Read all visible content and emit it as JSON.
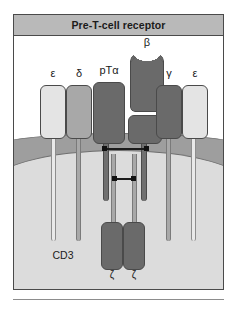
{
  "figure": {
    "title": "Pre-T-cell receptor",
    "complex_label": "CD3"
  },
  "chains": {
    "epsilon_left": "ε",
    "delta": "δ",
    "ptalpha": "pTα",
    "beta": "β",
    "gamma": "γ",
    "epsilon_right": "ε",
    "zeta_left": "ζ",
    "zeta_right": "ζ"
  },
  "colors": {
    "title_bar": "#b9b9b9",
    "frame_border": "#4a4a4a",
    "membrane": "#9e9e9e",
    "cytoplasm": "#dcdcdc",
    "chain_light": "#e4e4e4",
    "chain_mid": "#a8a8a8",
    "chain_dark": "#6a6a6a",
    "disulfide": "#111111"
  }
}
